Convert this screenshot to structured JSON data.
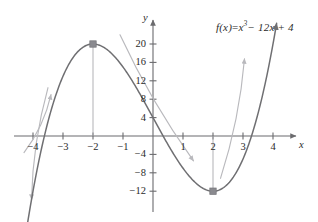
{
  "figure": {
    "equation": {
      "lhs": "f(x)",
      "equals": "=",
      "term_base": "x",
      "term_exponent": "3",
      "rest": "− 12x + 4",
      "plain": "f(x) = x³ − 12x + 4"
    },
    "axis_names": {
      "x": "x",
      "y": "y"
    },
    "colors": {
      "curve": "#6f6f72",
      "axis": "#6b6b6e",
      "annotation": "#b9b9bd",
      "marker": "#8a8a8f",
      "text": "#2b2b2b"
    }
  },
  "chart_data": {
    "type": "line",
    "xlabel": "x",
    "ylabel": "y",
    "xlim": [
      -4.6,
      4.6
    ],
    "ylim": [
      -16.5,
      23
    ],
    "grid": false,
    "legend": "none",
    "function": "x^3 - 12x + 4",
    "xticks": [
      -4,
      -3,
      -2,
      -1,
      1,
      2,
      3,
      4
    ],
    "xtick_labels": [
      "−4",
      "−3",
      "−2",
      "−1",
      "1",
      "2",
      "3",
      "4"
    ],
    "yticks": [
      20,
      16,
      12,
      8,
      4,
      -4,
      -8,
      -12
    ],
    "ytick_labels": [
      "20",
      "16",
      "12",
      "8",
      "4",
      "−4",
      "−8",
      "−12"
    ],
    "series": [
      {
        "name": "f(x) = x³ − 12x + 4",
        "x": [
          -4.0,
          -3.8,
          -3.6,
          -3.4,
          -3.2,
          -3.0,
          -2.8,
          -2.6,
          -2.4,
          -2.2,
          -2.0,
          -1.8,
          -1.6,
          -1.4,
          -1.2,
          -1.0,
          -0.8,
          -0.6,
          -0.4,
          -0.2,
          0.0,
          0.2,
          0.4,
          0.6,
          0.8,
          1.0,
          1.2,
          1.4,
          1.6,
          1.8,
          2.0,
          2.2,
          2.4,
          2.6,
          2.8,
          3.0,
          3.2,
          3.4,
          3.6,
          3.8,
          4.0
        ],
        "y": [
          -12.0,
          -5.27,
          0.66,
          5.82,
          10.24,
          13.0,
          15.65,
          17.62,
          18.98,
          19.75,
          20.0,
          19.77,
          19.1,
          18.06,
          16.67,
          15.0,
          13.09,
          12.98,
          8.74,
          2.4,
          4.0,
          1.61,
          -0.74,
          -3.0,
          -5.09,
          -7.0,
          -8.67,
          -10.06,
          -11.1,
          -11.77,
          -12.0,
          -11.75,
          -10.98,
          -9.62,
          -7.65,
          -5.0,
          -1.63,
          2.53,
          7.46,
          13.26,
          20.0
        ]
      }
    ],
    "annotations": [
      {
        "name": "local-maximum",
        "x": -2,
        "y": 20,
        "marker": "square",
        "drop_line": true,
        "label": ""
      },
      {
        "name": "local-minimum",
        "x": 2,
        "y": -12,
        "marker": "square",
        "drop_line": true,
        "label": ""
      }
    ],
    "arrows": [
      {
        "name": "increasing-left-arrow",
        "direction": "up-right",
        "from": [
          -4.3,
          -3.6
        ],
        "to": [
          -3.4,
          9.0
        ]
      },
      {
        "name": "decreasing-left-down-arrow",
        "direction": "down-left",
        "from": [
          -3.5,
          10.5
        ],
        "to": [
          -4.05,
          -13.8
        ]
      },
      {
        "name": "decreasing-middle-arrow",
        "direction": "down-right",
        "from": [
          -1.1,
          22.0
        ],
        "to": [
          1.35,
          -5.4
        ]
      },
      {
        "name": "increasing-right-arrow",
        "direction": "up-right",
        "from": [
          2.25,
          -9.2
        ],
        "to": [
          3.05,
          16.8
        ]
      }
    ]
  }
}
